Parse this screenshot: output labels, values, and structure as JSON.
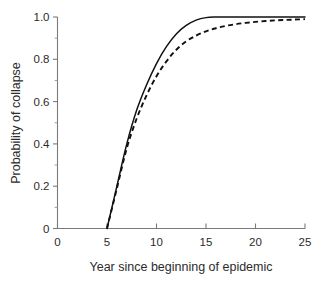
{
  "chart_data": {
    "type": "line",
    "title": "",
    "xlabel": "Year since beginning of epidemic",
    "ylabel": "Probability of collapse",
    "xlim": [
      0,
      25
    ],
    "ylim": [
      0,
      1.0
    ],
    "grid": false,
    "legend": "none",
    "xticks": [
      "0",
      "5",
      "10",
      "15",
      "20",
      "25"
    ],
    "xtick_values": [
      0,
      5,
      10,
      15,
      20,
      25
    ],
    "yticks": [
      "0",
      "0.2",
      "0.4",
      "0.6",
      "0.8",
      "1.0"
    ],
    "ytick_values": [
      0,
      0.2,
      0.4,
      0.6,
      0.8,
      1.0
    ],
    "y_minor_ticks": [
      0.1,
      0.3,
      0.5,
      0.7,
      0.9
    ],
    "x": [
      0,
      1,
      2,
      3,
      4,
      5,
      6,
      7,
      8,
      9,
      10,
      11,
      12,
      13,
      14,
      15,
      16,
      17,
      18,
      19,
      20,
      21,
      22,
      23,
      24,
      25
    ],
    "series": [
      {
        "name": "solid-curve",
        "style": "solid",
        "color": "#111111",
        "values": [
          0,
          0,
          0,
          0,
          0,
          0,
          0.2,
          0.4,
          0.56,
          0.68,
          0.78,
          0.86,
          0.92,
          0.96,
          0.985,
          0.997,
          1.0,
          1.0,
          1.0,
          1.0,
          1.0,
          1.0,
          1.0,
          1.0,
          1.0,
          1.0
        ]
      },
      {
        "name": "dashed-curve",
        "style": "dashed",
        "color": "#111111",
        "values": [
          0,
          0,
          0,
          0,
          0,
          0,
          0.19,
          0.38,
          0.52,
          0.63,
          0.72,
          0.79,
          0.845,
          0.885,
          0.912,
          0.932,
          0.947,
          0.958,
          0.966,
          0.972,
          0.977,
          0.981,
          0.984,
          0.986,
          0.988,
          0.99
        ]
      }
    ]
  }
}
